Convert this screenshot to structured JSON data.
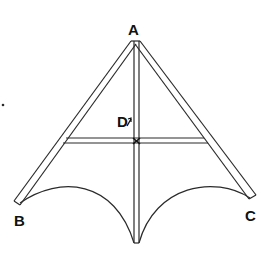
{
  "diagram": {
    "type": "kite-frame",
    "labels": {
      "A": "A",
      "B": "B",
      "C": "C",
      "D": "D"
    },
    "colors": {
      "line": "#2a2a2a",
      "text": "#111111",
      "background": "#ffffff"
    },
    "points": {
      "A": [
        136,
        40
      ],
      "B": [
        17,
        203
      ],
      "C": [
        252,
        197
      ],
      "D": [
        136,
        140
      ],
      "bottom": [
        136,
        243
      ]
    }
  }
}
